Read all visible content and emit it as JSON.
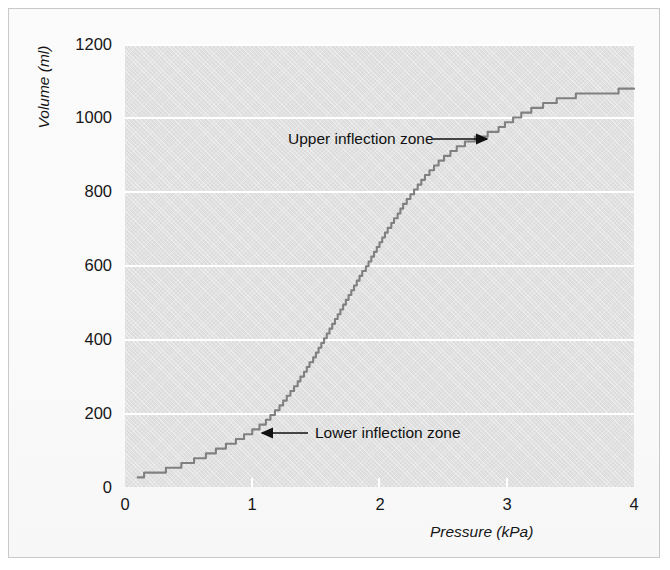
{
  "figure": {
    "background_color": "#fafafa",
    "border_color": "#c9c9c9",
    "plot_background_color": "#dcdcdc",
    "gridline_color": "#ffffff",
    "curve_color": "#808080",
    "text_color": "#161616"
  },
  "chart_data": {
    "type": "line",
    "title": "",
    "subtitle": "",
    "xlabel": "Pressure (kPa)",
    "ylabel": "Volume (ml)",
    "xlim": [
      0,
      4
    ],
    "ylim": [
      0,
      1200
    ],
    "xticks": [
      "0",
      "1",
      "2",
      "3",
      "4"
    ],
    "xtick_values": [
      0,
      1,
      2,
      3,
      4
    ],
    "yticks": [
      "0",
      "200",
      "400",
      "600",
      "800",
      "1000",
      "1200"
    ],
    "ytick_values": [
      0,
      200,
      400,
      600,
      800,
      1000,
      1200
    ],
    "grid": "horizontal-only",
    "legend": "none",
    "series": [
      {
        "name": "Pressure-volume curve",
        "style": "staircase-quantized sigmoid",
        "color": "#808080",
        "x": [
          0.1,
          0.2,
          0.3,
          0.4,
          0.5,
          0.6,
          0.7,
          0.8,
          0.9,
          1.0,
          1.1,
          1.2,
          1.3,
          1.4,
          1.5,
          1.6,
          1.7,
          1.8,
          1.9,
          2.0,
          2.1,
          2.2,
          2.3,
          2.4,
          2.5,
          2.6,
          2.7,
          2.8,
          2.9,
          3.0,
          3.1,
          3.2,
          3.3,
          3.4,
          3.5,
          3.6,
          3.7,
          3.8,
          3.9,
          4.0
        ],
        "y": [
          30,
          36,
          44,
          54,
          66,
          80,
          96,
          112,
          130,
          150,
          175,
          210,
          255,
          305,
          360,
          420,
          480,
          540,
          600,
          660,
          715,
          768,
          815,
          855,
          890,
          915,
          935,
          950,
          962,
          985,
          1005,
          1022,
          1036,
          1048,
          1057,
          1063,
          1068,
          1071,
          1073,
          1075
        ]
      }
    ],
    "annotations": [
      {
        "id": "upper-inflection",
        "text": "Upper inflection zone",
        "arrow_direction": "right",
        "points_to": {
          "x": 2.92,
          "y": 940
        }
      },
      {
        "id": "lower-inflection",
        "text": "Lower inflection zone",
        "arrow_direction": "left",
        "points_to": {
          "x": 1.05,
          "y": 165
        }
      }
    ]
  }
}
